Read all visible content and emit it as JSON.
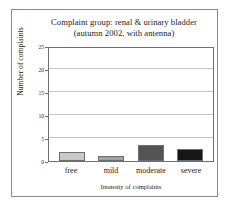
{
  "chart_data": {
    "type": "bar",
    "title": "Complaint group: renal & urinary bladder",
    "subtitle": "(autumn 2002, with antenna)",
    "xlabel": "Intensity of complaints",
    "ylabel": "Number of complaints",
    "categories": [
      "free",
      "mild",
      "moderate",
      "severe"
    ],
    "values": [
      2,
      1,
      3.5,
      2.7
    ],
    "bar_colors": [
      "#c9c9c9",
      "#a3a3a3",
      "#545454",
      "#171717"
    ],
    "ylim": [
      0,
      25
    ],
    "yticks": [
      0,
      5,
      10,
      15,
      20,
      25
    ],
    "ytick_labels": [
      "0",
      "5",
      "10",
      "15",
      "20",
      "25"
    ],
    "grid": true,
    "grid_axis": "y",
    "legend": "none"
  },
  "colors": {
    "frame": "#8a8a8a",
    "axis": "#6e6e6e",
    "gridline": "#c4c4c4",
    "text": "#1d1d1d",
    "background": "#ffffff"
  }
}
